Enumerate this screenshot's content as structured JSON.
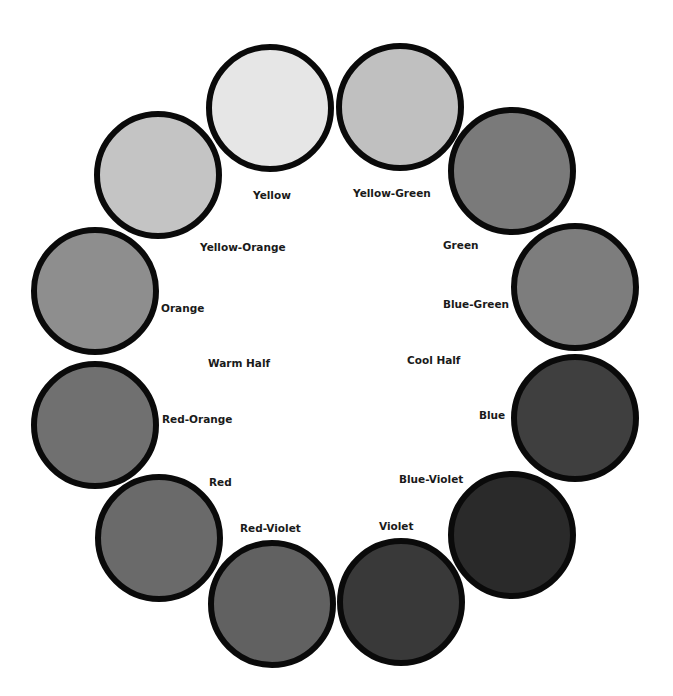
{
  "diagram": {
    "type": "color-wheel",
    "circle_radius": 64,
    "border_color": "#0a0a0a",
    "background": "#ffffff",
    "colors": [
      {
        "name": "Yellow",
        "fill": "#e6e6e6",
        "cx": 270,
        "cy": 108,
        "label_x": 253,
        "label_y": 195
      },
      {
        "name": "Yellow-Green",
        "fill": "#c0c0c0",
        "cx": 400,
        "cy": 107,
        "label_x": 353,
        "label_y": 193
      },
      {
        "name": "Green",
        "fill": "#7a7a7a",
        "cx": 512,
        "cy": 171,
        "label_x": 443,
        "label_y": 245
      },
      {
        "name": "Blue-Green",
        "fill": "#7d7d7d",
        "cx": 575,
        "cy": 287,
        "label_x": 443,
        "label_y": 304
      },
      {
        "name": "Blue",
        "fill": "#3f3f3f",
        "cx": 575,
        "cy": 418,
        "label_x": 479,
        "label_y": 415
      },
      {
        "name": "Blue-Violet",
        "fill": "#2a2a2a",
        "cx": 512,
        "cy": 535,
        "label_x": 399,
        "label_y": 479
      },
      {
        "name": "Violet",
        "fill": "#393939",
        "cx": 401,
        "cy": 602,
        "label_x": 379,
        "label_y": 526
      },
      {
        "name": "Red-Violet",
        "fill": "#616161",
        "cx": 272,
        "cy": 604,
        "label_x": 240,
        "label_y": 528
      },
      {
        "name": "Red",
        "fill": "#6a6a6a",
        "cx": 159,
        "cy": 538,
        "label_x": 209,
        "label_y": 482
      },
      {
        "name": "Red-Orange",
        "fill": "#707070",
        "cx": 95,
        "cy": 425,
        "label_x": 162,
        "label_y": 419
      },
      {
        "name": "Orange",
        "fill": "#8e8e8e",
        "cx": 95,
        "cy": 291,
        "label_x": 161,
        "label_y": 308
      },
      {
        "name": "Yellow-Orange",
        "fill": "#c4c4c4",
        "cx": 158,
        "cy": 175,
        "label_x": 200,
        "label_y": 247
      }
    ],
    "halves": [
      {
        "name": "Warm Half",
        "label_x": 208,
        "label_y": 363
      },
      {
        "name": "Cool Half",
        "label_x": 407,
        "label_y": 360
      }
    ]
  }
}
